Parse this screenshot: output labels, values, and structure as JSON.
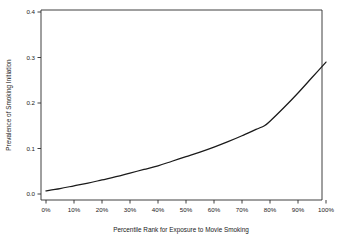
{
  "chart_data": {
    "type": "line",
    "title": "",
    "xlabel": "Percentile Rank for Exposure to Movie Smoking",
    "ylabel": "Prevalence of Smoking Initiation",
    "xlim": [
      0,
      100
    ],
    "ylim": [
      0.0,
      0.42
    ],
    "grid": false,
    "legend": null,
    "x_tick_labels": [
      "0%",
      "10%",
      "20%",
      "30%",
      "40%",
      "50%",
      "60%",
      "70%",
      "80%",
      "90%",
      "100%"
    ],
    "x_tick_values": [
      0,
      10,
      20,
      30,
      40,
      50,
      60,
      70,
      80,
      90,
      100
    ],
    "y_tick_labels": [
      "0.0",
      "0.1",
      "0.2",
      "0.3",
      "0.4"
    ],
    "y_tick_values": [
      0.0,
      0.1,
      0.2,
      0.3,
      0.4
    ],
    "series": [
      {
        "name": "Prevalence of Smoking Initiation",
        "color": "#1a1a1a",
        "x": [
          0,
          5,
          10,
          15,
          20,
          25,
          30,
          35,
          40,
          45,
          50,
          55,
          60,
          65,
          70,
          75,
          78,
          80,
          85,
          90,
          95,
          100
        ],
        "values": [
          0.007,
          0.012,
          0.018,
          0.024,
          0.031,
          0.038,
          0.046,
          0.054,
          0.062,
          0.072,
          0.082,
          0.092,
          0.103,
          0.115,
          0.128,
          0.142,
          0.15,
          0.16,
          0.19,
          0.222,
          0.256,
          0.29
        ]
      }
    ]
  },
  "axes": {
    "x_title": "Percentile Rank for Exposure to Movie Smoking",
    "y_title": "Prevalence of Smoking Initiation"
  }
}
